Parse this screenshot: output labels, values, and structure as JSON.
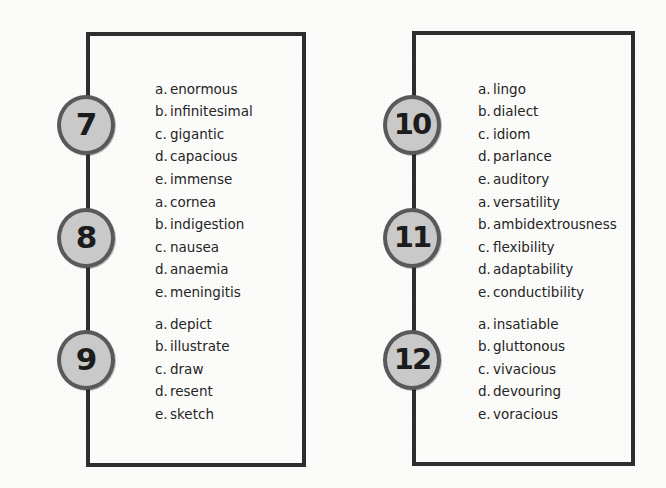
{
  "page": {
    "background_color": "#fcfcfa",
    "frame_color": "#2e2e2e",
    "badge_fill_color": "#c9c9c9",
    "badge_ring_color": "#595959",
    "text_color": "#252525"
  },
  "panels": [
    {
      "name": "left-column",
      "questions": [
        {
          "number": "7",
          "options": [
            {
              "letter": "a.",
              "text": "enormous"
            },
            {
              "letter": "b.",
              "text": "infinitesimal"
            },
            {
              "letter": "c.",
              "text": "gigantic"
            },
            {
              "letter": "d.",
              "text": "capacious"
            },
            {
              "letter": "e.",
              "text": "immense"
            }
          ]
        },
        {
          "number": "8",
          "options": [
            {
              "letter": "a.",
              "text": "cornea"
            },
            {
              "letter": "b.",
              "text": "indigestion"
            },
            {
              "letter": "c.",
              "text": "nausea"
            },
            {
              "letter": "d.",
              "text": "anaemia"
            },
            {
              "letter": "e.",
              "text": "meningitis"
            }
          ]
        },
        {
          "number": "9",
          "options": [
            {
              "letter": "a.",
              "text": "depict"
            },
            {
              "letter": "b.",
              "text": "illustrate"
            },
            {
              "letter": "c.",
              "text": "draw"
            },
            {
              "letter": "d.",
              "text": "resent"
            },
            {
              "letter": "e.",
              "text": "sketch"
            }
          ]
        }
      ]
    },
    {
      "name": "right-column",
      "questions": [
        {
          "number": "10",
          "options": [
            {
              "letter": "a.",
              "text": "lingo"
            },
            {
              "letter": "b.",
              "text": "dialect"
            },
            {
              "letter": "c.",
              "text": "idiom"
            },
            {
              "letter": "d.",
              "text": "parlance"
            },
            {
              "letter": "e.",
              "text": "auditory"
            }
          ]
        },
        {
          "number": "11",
          "options": [
            {
              "letter": "a.",
              "text": "versatility"
            },
            {
              "letter": "b.",
              "text": "ambidextrousness"
            },
            {
              "letter": "c.",
              "text": "flexibility"
            },
            {
              "letter": "d.",
              "text": "adaptability"
            },
            {
              "letter": "e.",
              "text": "conductibility"
            }
          ]
        },
        {
          "number": "12",
          "options": [
            {
              "letter": "a.",
              "text": "insatiable"
            },
            {
              "letter": "b.",
              "text": "gluttonous"
            },
            {
              "letter": "c.",
              "text": "vivacious"
            },
            {
              "letter": "d.",
              "text": "devouring"
            },
            {
              "letter": "e.",
              "text": "voracious"
            }
          ]
        }
      ]
    }
  ]
}
